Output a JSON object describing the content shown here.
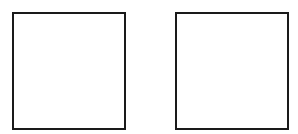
{
  "boxes": [
    {
      "id": "left",
      "label": "",
      "border_color": "#1a1a1a",
      "fill": "#ffffff"
    },
    {
      "id": "right",
      "label": "",
      "border_color": "#1a1a1a",
      "fill": "#ffffff"
    }
  ]
}
